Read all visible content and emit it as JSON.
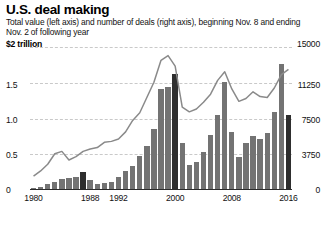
{
  "header": {
    "title": "U.S. deal making",
    "subtitle": "Total value (left axis) and number of deals (right axis), beginning Nov. 8 and ending Nov. 2 of following year"
  },
  "axes": {
    "left_unit_label": "$2 trillion",
    "left_ticks": [
      "1.5",
      "1.0",
      "0.5",
      "0"
    ],
    "right_top_label": "15000",
    "right_ticks": [
      "11250",
      "7500",
      "3750",
      "0"
    ],
    "x_ticks": [
      "1980",
      "1988",
      "1992",
      "2000",
      "2008",
      "2016"
    ]
  },
  "colors": {
    "bar": "#737373",
    "bar_highlight": "#2e2e2e",
    "line": "#8a8a8a",
    "grid": "#c9c9c9",
    "axis": "#2b2b2b",
    "text": "#111111"
  },
  "chart_data": {
    "type": "bar",
    "title": "U.S. deal making",
    "subtitle": "Total value (left axis) and number of deals (right axis), beginning Nov. 8 and ending Nov. 2 of following year",
    "xlabel": "",
    "ylabel": "$ trillion",
    "y2label": "number of deals",
    "ylim": [
      0,
      2
    ],
    "y2lim": [
      0,
      15000
    ],
    "yticks": [
      0,
      0.5,
      1.0,
      1.5,
      2.0
    ],
    "y2ticks": [
      0,
      3750,
      7500,
      11250,
      15000
    ],
    "grid": true,
    "legend": "none",
    "xticks_shown": [
      1980,
      1988,
      1992,
      2000,
      2008,
      2016
    ],
    "categories": [
      1980,
      1981,
      1982,
      1983,
      1984,
      1985,
      1986,
      1987,
      1988,
      1989,
      1990,
      1991,
      1992,
      1993,
      1994,
      1995,
      1996,
      1997,
      1998,
      1999,
      2000,
      2001,
      2002,
      2003,
      2004,
      2005,
      2006,
      2007,
      2008,
      2009,
      2010,
      2011,
      2012,
      2013,
      2014,
      2015,
      2016
    ],
    "series": [
      {
        "name": "Total value",
        "axis": "left",
        "type": "bar",
        "unit": "$ trillion",
        "values": [
          0.03,
          0.05,
          0.08,
          0.12,
          0.16,
          0.17,
          0.19,
          0.26,
          0.14,
          0.09,
          0.1,
          0.12,
          0.19,
          0.27,
          0.34,
          0.48,
          0.62,
          0.86,
          1.42,
          1.44,
          1.63,
          0.66,
          0.35,
          0.39,
          0.54,
          0.77,
          1.05,
          1.52,
          0.82,
          0.46,
          0.66,
          0.76,
          0.72,
          0.8,
          1.1,
          1.77,
          1.61
        ]
      },
      {
        "name": "Number of deals",
        "axis": "right",
        "type": "line",
        "unit": "deals",
        "values": [
          1450,
          2000,
          2700,
          3800,
          4050,
          3150,
          3500,
          4050,
          4300,
          4450,
          5000,
          5100,
          5350,
          6100,
          7300,
          8100,
          9700,
          11300,
          13600,
          14100,
          13000,
          8700,
          8200,
          8500,
          9200,
          10050,
          11500,
          12400,
          10600,
          9300,
          9600,
          10300,
          9800,
          9700,
          10700,
          12100,
          12650
        ]
      },
      {
        "name": "Highlighted years",
        "type": "annotation",
        "highlight_years": [
          1987,
          2000,
          2016
        ]
      }
    ],
    "final_bar_value": 1.05,
    "final_bar_note": "2016 bar is partial-year (through Nov. 2) and drawn dark"
  }
}
